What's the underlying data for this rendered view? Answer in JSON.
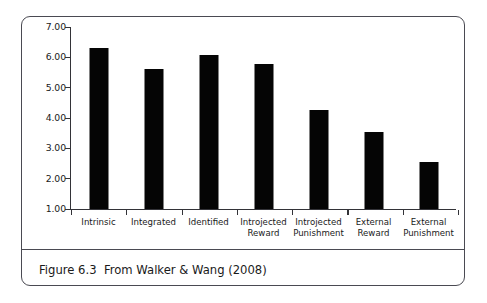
{
  "figure": {
    "caption": "Figure 6.3  From Walker & Wang (2008)",
    "frame_color": "#4a4a52",
    "bar_color": "#050505",
    "axis_color": "#333338",
    "background": "#ffffff"
  },
  "chart_data": {
    "type": "bar",
    "title": "",
    "subtitle": "",
    "xlabel": "",
    "ylabel": "",
    "categories": [
      "Intrinsic",
      "Integrated",
      "Identified",
      "Introjected Reward",
      "Introjected Punishment",
      "External Reward",
      "External Punishment"
    ],
    "category_lines": [
      [
        "Intrinsic"
      ],
      [
        "Integrated"
      ],
      [
        "Identified"
      ],
      [
        "Introjected",
        "Reward"
      ],
      [
        "Introjected",
        "Punishment"
      ],
      [
        "External",
        "Reward"
      ],
      [
        "External",
        "Punishment"
      ]
    ],
    "values": [
      6.32,
      5.62,
      6.08,
      5.78,
      4.26,
      3.54,
      2.55
    ],
    "ylim": [
      1.0,
      7.0
    ],
    "ytick_values": [
      1.0,
      2.0,
      3.0,
      4.0,
      5.0,
      6.0,
      7.0
    ],
    "ytick_labels": [
      "1.00",
      "2.00",
      "3.00",
      "4.00",
      "5.00",
      "6.00",
      "7.00"
    ],
    "grid": false,
    "legend": null,
    "series": [
      {
        "name": "Motivation rating",
        "values": [
          6.32,
          5.62,
          6.08,
          5.78,
          4.26,
          3.54,
          2.55
        ]
      }
    ]
  }
}
